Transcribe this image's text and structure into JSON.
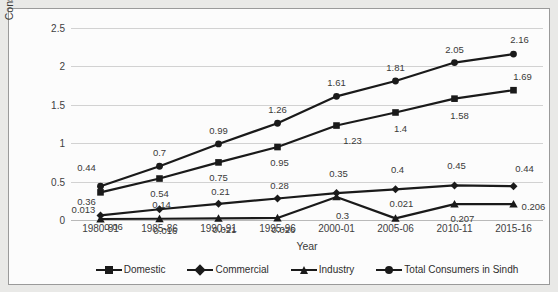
{
  "chart_data": {
    "type": "line",
    "title": "",
    "xlabel": "Year",
    "ylabel": "Consumers (in Million)",
    "categories": [
      "1980-81",
      "1985-86",
      "1990-91",
      "1995-96",
      "2000-01",
      "2005-06",
      "2010-11",
      "2015-16"
    ],
    "ylim": [
      0,
      2.5
    ],
    "yticks": [
      0,
      0.5,
      1,
      1.5,
      2,
      2.5
    ],
    "ytick_labels": [
      "0",
      "0.5",
      "1",
      "1.5",
      "2",
      "2.5"
    ],
    "grid": true,
    "legend_position": "bottom",
    "series": [
      {
        "name": "Domestic",
        "marker": "square",
        "values": [
          0.36,
          0.54,
          0.75,
          0.95,
          1.23,
          1.4,
          1.58,
          1.69
        ],
        "labels": [
          "0.36",
          "0.54",
          "0.75",
          "0.95",
          "1.23",
          "1.4",
          "1.58",
          "1.69"
        ]
      },
      {
        "name": "Commercial",
        "marker": "diamond",
        "values": [
          0.06,
          0.14,
          0.21,
          0.28,
          0.35,
          0.4,
          0.45,
          0.44
        ],
        "labels": [
          "0.06",
          "0.14",
          "0.21",
          "0.28",
          "0.35",
          "0.4",
          "0.45",
          "0.44"
        ]
      },
      {
        "name": "Industry",
        "marker": "triangle",
        "values": [
          0.013,
          0.016,
          0.021,
          0.026,
          0.3,
          0.021,
          0.207,
          0.206
        ],
        "labels": [
          "0.013",
          "0.016",
          "0.021",
          "0.026",
          "0.3",
          "0.021",
          "0.207",
          "0.206"
        ]
      },
      {
        "name": "Total Consumers in Sindh",
        "marker": "circle",
        "values": [
          0.44,
          0.7,
          0.99,
          1.26,
          1.61,
          1.81,
          2.05,
          2.16
        ],
        "labels": [
          "0.44",
          "0.7",
          "0.99",
          "1.26",
          "1.61",
          "1.81",
          "2.05",
          "2.16"
        ]
      }
    ],
    "series_color": "#1a1a1a"
  }
}
